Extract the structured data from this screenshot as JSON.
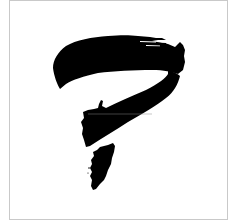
{
  "artwork": {
    "title": "Ink brush question mark",
    "alt_text": "Black calligraphic brush-stroke question mark on white",
    "colors": {
      "background": "#ffffff",
      "ink": "#000000",
      "frame": "#c9c9c9",
      "scan_line": "#8a8a8a"
    },
    "strokes": [
      {
        "name": "top-arc-stroke"
      },
      {
        "name": "descending-curve-stroke"
      },
      {
        "name": "bottom-dot-stroke"
      }
    ]
  }
}
